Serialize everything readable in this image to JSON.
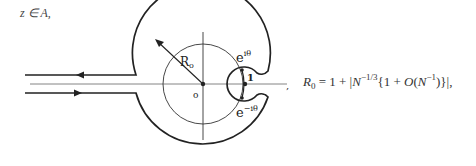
{
  "condition": {
    "text": "z ∈ A,"
  },
  "diagram": {
    "labels": {
      "radius": "R",
      "radius_sub": "o",
      "origin": "o",
      "point_one": "1",
      "upper_point": "e",
      "upper_point_exp": "iθ",
      "lower_point": "e",
      "lower_point_exp": "−iθ"
    }
  },
  "formula": {
    "lhs": "R",
    "lhs_sub": "0",
    "eq": " = 1 + |",
    "N1": "N",
    "exp1": "−1/3",
    "mid": "{1 + ",
    "O": "O",
    "paren_open": "(",
    "N2": "N",
    "exp2": "−1",
    "tail": ")}|,"
  },
  "separator": ","
}
